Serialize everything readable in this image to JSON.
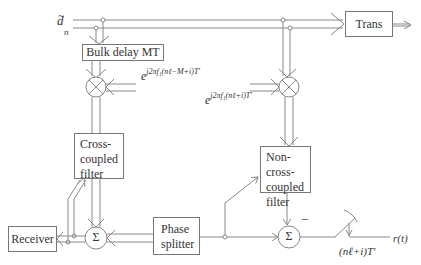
{
  "input": {
    "symbol": "d",
    "tilde": "~",
    "subscript": "n"
  },
  "blocks": {
    "trans": "Trans",
    "bulk_delay": "Bulk delay MT",
    "cross_coupled_filter": [
      "Cross-",
      "coupled",
      "filter"
    ],
    "non_cross_coupled_filter": [
      "Non-cross-",
      "coupled",
      "filter"
    ],
    "phase_splitter": [
      "Phase",
      "splitter"
    ],
    "receiver": "Receiver"
  },
  "mixers": {
    "left_exponent_base": "e",
    "left_exponent": "j2πf₁(nℓ−M+i)T'",
    "right_exponent_base": "e",
    "right_exponent": "j2πf₁(nℓ+i)T'"
  },
  "summers": {
    "left_symbol": "Σ",
    "right_symbol": "Σ",
    "right_sign": "−"
  },
  "sampler": {
    "sampling_label": "(nℓ+i)T'",
    "output_label": "r(t)"
  },
  "colors": {
    "line": "#888888",
    "box_border": "#777777",
    "text": "#333333",
    "background": "#ffffff"
  }
}
